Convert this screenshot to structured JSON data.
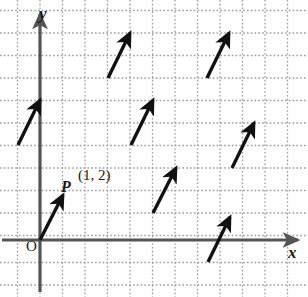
{
  "figure": {
    "kind": "vector-field-diagram",
    "width": 308,
    "height": 297,
    "background": "#ffffff"
  },
  "axes": {
    "x_label": "x",
    "y_label": "y",
    "origin_label": "O",
    "axis_color": "#555555",
    "x_axis": {
      "y_px": 240,
      "x_start_px": 2,
      "x_end_px": 298
    },
    "y_axis": {
      "x_px": 40,
      "y_start_px": 292,
      "y_end_px": 14
    }
  },
  "grid": {
    "color": "#9a9aa8",
    "style": "dotted",
    "spacing_px": 22.5,
    "vertical_lines_px": [
      17.5,
      40,
      62.5,
      85,
      107.5,
      130,
      152.5,
      175,
      197.5,
      220,
      242.5,
      265,
      287.5
    ],
    "horizontal_lines_px": [
      10.5,
      33,
      55.5,
      78,
      100.5,
      123,
      145.5,
      168,
      190.5,
      213,
      235.5,
      262.5,
      285
    ]
  },
  "point": {
    "name": "P",
    "coordinates": "(1, 2)"
  },
  "vector": {
    "dx_units": 1,
    "dy_units": 2,
    "color": "#111111"
  },
  "chart_data": {
    "type": "scatter",
    "title": "",
    "xlabel": "x",
    "ylabel": "y",
    "grid": true,
    "legend": false,
    "arrows": [
      {
        "id": "arrow-origin-P",
        "x1": 40,
        "y1": 240,
        "x2": 63,
        "y2": 195,
        "label": "P"
      },
      {
        "id": "arrow-left",
        "x1": 18,
        "y1": 145,
        "x2": 40,
        "y2": 100,
        "label": ""
      },
      {
        "id": "arrow-top-mid",
        "x1": 108,
        "y1": 78,
        "x2": 130,
        "y2": 33,
        "label": ""
      },
      {
        "id": "arrow-top-right",
        "x1": 207,
        "y1": 78,
        "x2": 229,
        "y2": 33,
        "label": ""
      },
      {
        "id": "arrow-mid",
        "x1": 131,
        "y1": 145,
        "x2": 153,
        "y2": 100,
        "label": ""
      },
      {
        "id": "arrow-right",
        "x1": 232,
        "y1": 168,
        "x2": 254,
        "y2": 123,
        "label": ""
      },
      {
        "id": "arrow-low-mid",
        "x1": 153,
        "y1": 213,
        "x2": 176,
        "y2": 168,
        "label": ""
      },
      {
        "id": "arrow-bottom",
        "x1": 208,
        "y1": 262,
        "x2": 230,
        "y2": 217,
        "label": ""
      }
    ]
  }
}
